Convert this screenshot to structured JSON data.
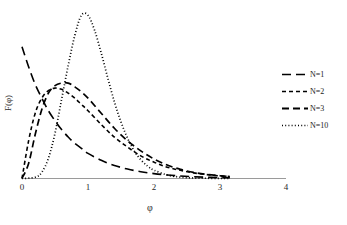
{
  "chart_data": {
    "type": "line",
    "title": "",
    "xlabel": "φ",
    "ylabel": "F(φ)",
    "xlim": [
      0,
      4
    ],
    "ylim": [
      0,
      1.35
    ],
    "xticks": [
      0,
      1,
      2,
      3,
      4
    ],
    "xtick_labels": [
      "0",
      "1",
      "2",
      "3",
      "4"
    ],
    "yticks": [],
    "ytick_labels": [],
    "grid": false,
    "legend_position": "right",
    "x_domain_drawn": [
      0,
      3.15
    ],
    "series": [
      {
        "name": "N=1",
        "label": "N=1",
        "dash": "long-dash",
        "dasharray": "9 5",
        "width": 1.6,
        "shape": "gamma",
        "k": 1,
        "scale": 0.62,
        "peak_x": 0.0,
        "peak_y": 1.05,
        "x": [
          0.0,
          0.1,
          0.2,
          0.3,
          0.4,
          0.5,
          0.6,
          0.7,
          0.8,
          0.9,
          1.0,
          1.2,
          1.4,
          1.6,
          1.8,
          2.0,
          2.2,
          2.4,
          2.6,
          2.8,
          3.0,
          3.15
        ],
        "y": [
          1.05,
          0.89,
          0.75,
          0.64,
          0.54,
          0.46,
          0.39,
          0.33,
          0.28,
          0.24,
          0.2,
          0.145,
          0.104,
          0.075,
          0.054,
          0.039,
          0.028,
          0.02,
          0.014,
          0.01,
          0.007,
          0.006
        ]
      },
      {
        "name": "N=2",
        "label": "N=2",
        "dash": "short-dash",
        "dasharray": "4 3",
        "width": 1.6,
        "shape": "gamma",
        "k": 2,
        "scale": 0.42,
        "peak_x": 0.55,
        "peak_y": 0.72,
        "x": [
          0.0,
          0.1,
          0.2,
          0.3,
          0.4,
          0.5,
          0.6,
          0.7,
          0.8,
          0.9,
          1.0,
          1.2,
          1.4,
          1.6,
          1.8,
          2.0,
          2.2,
          2.4,
          2.6,
          2.8,
          3.0,
          3.15
        ],
        "y": [
          0.0,
          0.3,
          0.52,
          0.64,
          0.7,
          0.72,
          0.71,
          0.68,
          0.64,
          0.59,
          0.54,
          0.43,
          0.33,
          0.25,
          0.18,
          0.13,
          0.09,
          0.065,
          0.045,
          0.031,
          0.021,
          0.016
        ]
      },
      {
        "name": "N=3",
        "label": "N=3",
        "dash": "medium-dash",
        "dasharray": "7 4",
        "width": 1.7,
        "shape": "gamma",
        "k": 3,
        "scale": 0.33,
        "peak_x": 0.72,
        "peak_y": 0.76,
        "x": [
          0.0,
          0.1,
          0.2,
          0.3,
          0.4,
          0.5,
          0.6,
          0.7,
          0.8,
          0.9,
          1.0,
          1.2,
          1.4,
          1.6,
          1.8,
          2.0,
          2.2,
          2.4,
          2.6,
          2.8,
          3.0,
          3.15
        ],
        "y": [
          0.0,
          0.12,
          0.35,
          0.55,
          0.68,
          0.74,
          0.76,
          0.76,
          0.73,
          0.69,
          0.64,
          0.52,
          0.4,
          0.3,
          0.22,
          0.155,
          0.107,
          0.073,
          0.049,
          0.033,
          0.022,
          0.016
        ]
      },
      {
        "name": "N=10",
        "label": "N=10",
        "dash": "dotted",
        "dasharray": "1 2.2",
        "width": 1.7,
        "shape": "gamma",
        "k": 10,
        "scale": 0.1,
        "peak_x": 0.9,
        "peak_y": 1.3,
        "x": [
          0.0,
          0.2,
          0.3,
          0.4,
          0.5,
          0.6,
          0.7,
          0.8,
          0.9,
          1.0,
          1.1,
          1.2,
          1.3,
          1.4,
          1.5,
          1.6,
          1.7,
          1.8,
          1.9,
          2.0,
          2.2,
          2.4,
          2.6,
          2.8,
          3.0,
          3.15
        ],
        "y": [
          0.0,
          0.01,
          0.05,
          0.16,
          0.36,
          0.63,
          0.9,
          1.14,
          1.3,
          1.3,
          1.18,
          1.0,
          0.8,
          0.61,
          0.45,
          0.32,
          0.22,
          0.15,
          0.1,
          0.066,
          0.028,
          0.011,
          0.004,
          0.002,
          0.001,
          0.0
        ]
      }
    ]
  },
  "axes": {
    "x_title": "φ",
    "y_title": "F(φ)"
  },
  "legend": {
    "entries": [
      {
        "label": "N=1"
      },
      {
        "label": "N=2"
      },
      {
        "label": "N=3"
      },
      {
        "label": "N=10"
      }
    ]
  },
  "ticks": {
    "labels": [
      "0",
      "1",
      "2",
      "3",
      "4"
    ]
  }
}
